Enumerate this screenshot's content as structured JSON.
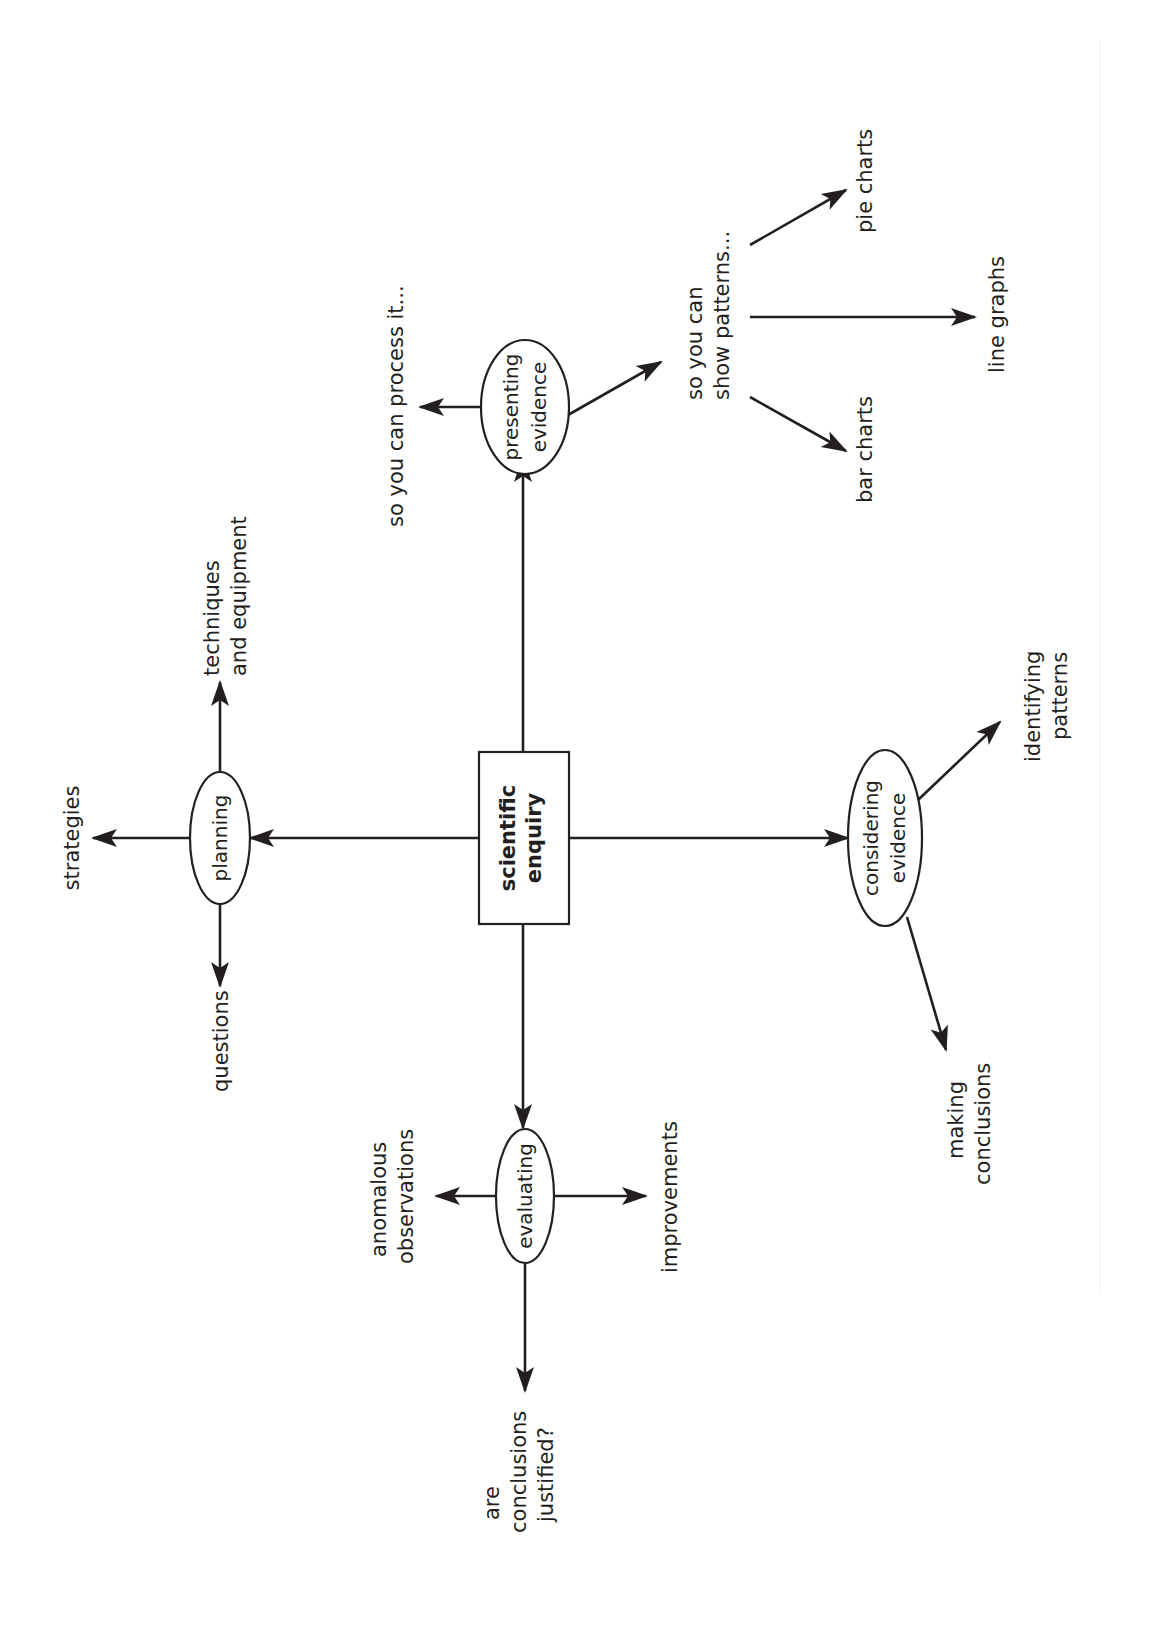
{
  "diagram": {
    "type": "concept-map",
    "orientation": "rotated-90-ccw",
    "colors": {
      "ink": "#231f20",
      "background": "#ffffff"
    },
    "center": {
      "line1": "scientific",
      "line2": "enquiry"
    },
    "planning": {
      "label": "planning",
      "children": {
        "strategies": "strategies",
        "techniques_line1": "techniques",
        "techniques_line2": "and equipment",
        "questions": "questions"
      }
    },
    "presenting": {
      "line1": "presenting",
      "line2": "evidence",
      "children": {
        "process": "so you can process it...",
        "patterns_line1": "so you can",
        "patterns_line2": "show patterns...",
        "pie": "pie charts",
        "line": "line graphs",
        "bar": "bar charts"
      }
    },
    "considering": {
      "line1": "considering",
      "line2": "evidence",
      "children": {
        "identifying_line1": "identifying",
        "identifying_line2": "patterns",
        "making_line1": "making",
        "making_line2": "conclusions"
      }
    },
    "evaluating": {
      "label": "evaluating",
      "children": {
        "anomalous_line1": "anomalous",
        "anomalous_line2": "observations",
        "improvements": "improvements",
        "justified_line1": "are",
        "justified_line2": "conclusions",
        "justified_line3": "justified?"
      }
    }
  }
}
